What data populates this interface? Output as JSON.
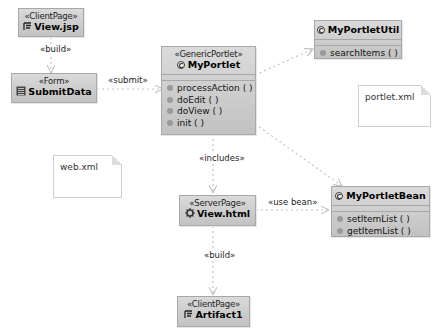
{
  "diagram": {
    "nodes": {
      "view_jsp": {
        "stereotype": "«ClientPage»",
        "name": "View.jsp",
        "icon": "client-page-icon"
      },
      "submit_data": {
        "stereotype": "«Form»",
        "name": "SubmitData",
        "icon": "form-icon"
      },
      "my_portlet": {
        "stereotype": "«GenericPortlet»",
        "name": "MyPortlet",
        "icon": "class-icon",
        "operations": [
          "processAction ( )",
          "doEdit ( )",
          "doView ( )",
          "init ( )"
        ]
      },
      "my_portlet_util": {
        "name": "MyPortletUtil",
        "icon": "class-icon",
        "operations": [
          "searchItems ( )"
        ]
      },
      "my_portlet_bean": {
        "name": "MyPortletBean",
        "icon": "class-icon",
        "operations": [
          "setItemList ( )",
          "getItemList ( )"
        ]
      },
      "view_html": {
        "stereotype": "«ServerPage»",
        "name": "View.html",
        "icon": "server-page-icon"
      },
      "artifact1": {
        "stereotype": "«ClientPage»",
        "name": "Artifact1",
        "icon": "client-page-icon"
      }
    },
    "notes": {
      "web_xml": "web.xml",
      "portlet_xml": "portlet.xml"
    },
    "edges": {
      "build_top": "«build»",
      "submit": "«submit»",
      "includes": "«includes»",
      "use_bean": "«use bean»",
      "build_bottom": "«build»"
    },
    "colors": {
      "box_fill_top": "#dadada",
      "box_fill_bottom": "#c2c2c2",
      "box_border": "#a8a8a8",
      "edge": "#c8c8c8"
    }
  }
}
